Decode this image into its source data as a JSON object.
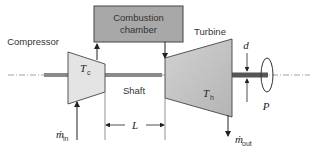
{
  "diagram": {
    "colors": {
      "box_fill": "#a8a8a8",
      "turbine_fill": "#c4c4c4",
      "compressor_fill": "#e2e2e2",
      "shaft_fill": "#777777",
      "line": "#333333"
    },
    "labels": {
      "compressor": "Compressor",
      "combustion_line1": "Combustion",
      "combustion_line2": "chamber",
      "turbine": "Turbine",
      "shaft": "Shaft",
      "compressor_temp": "T",
      "compressor_temp_sub": "c",
      "turbine_temp": "T",
      "turbine_temp_sub": "h",
      "diameter": "d",
      "power": "P",
      "length": "L",
      "mass_in": "ṁ",
      "mass_in_sub": "in",
      "mass_out": "ṁ",
      "mass_out_sub": "out"
    }
  }
}
